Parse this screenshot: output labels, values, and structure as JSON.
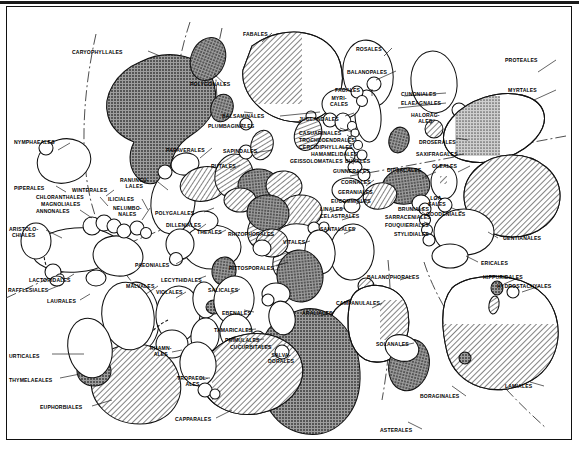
{
  "figure": {
    "kind": "taxonomic-bubble-diagram",
    "colors": {
      "outline": "#111111",
      "background": "#ffffff",
      "fill_dark": "#8d8d8d",
      "fill_hatch": "#b9b9b9",
      "fill_open": "#ffffff",
      "dash_boundary": "#333333"
    },
    "shading_legend_implicit": [
      "open",
      "stipple-dark",
      "diagonal-hatch"
    ]
  },
  "labels": [
    {
      "id": "caryophyllales",
      "text": "CARYOPHYLLALES",
      "x": 72,
      "y": 50,
      "align": "left"
    },
    {
      "id": "fabales",
      "text": "FABALES",
      "x": 243,
      "y": 32,
      "align": "left"
    },
    {
      "id": "rosales",
      "text": "ROSALES",
      "x": 356,
      "y": 47,
      "align": "left"
    },
    {
      "id": "proteales",
      "text": "PROTEALES",
      "x": 505,
      "y": 58,
      "align": "left"
    },
    {
      "id": "balanopales",
      "text": "BALANOPALES",
      "x": 347,
      "y": 70,
      "align": "left"
    },
    {
      "id": "myrtales",
      "text": "MYRTALES",
      "x": 508,
      "y": 88,
      "align": "left"
    },
    {
      "id": "polygonales",
      "text": "POLYGONALES",
      "x": 190,
      "y": 82,
      "align": "left"
    },
    {
      "id": "cunoniales",
      "text": "CUNONIALES",
      "x": 401,
      "y": 92,
      "align": "left"
    },
    {
      "id": "fagales",
      "text": "FAGALES",
      "x": 335,
      "y": 88,
      "align": "left"
    },
    {
      "id": "elaeagnales",
      "text": "ELAEAGNALES",
      "x": 401,
      "y": 101,
      "align": "left"
    },
    {
      "id": "myricales",
      "text": "MYRI-\nCALES",
      "x": 330,
      "y": 96,
      "align": "left"
    },
    {
      "id": "balsaminales",
      "text": "BALSAMINALES",
      "x": 222,
      "y": 114,
      "align": "left"
    },
    {
      "id": "haloragales",
      "text": "HALORAG-\nALES",
      "x": 411,
      "y": 113,
      "align": "left"
    },
    {
      "id": "juglandales",
      "text": "JUGLANDALES",
      "x": 299,
      "y": 117,
      "align": "left"
    },
    {
      "id": "plumbaginales",
      "text": "PLUMBAGINALES",
      "x": 208,
      "y": 124,
      "align": "left"
    },
    {
      "id": "nymphaeales",
      "text": "NYMPHAEALES",
      "x": 14,
      "y": 140,
      "align": "left"
    },
    {
      "id": "casuarinales",
      "text": "CASUARINALES",
      "x": 299,
      "y": 131,
      "align": "left"
    },
    {
      "id": "droserales",
      "text": "DROSERALES",
      "x": 419,
      "y": 140,
      "align": "left"
    },
    {
      "id": "trochodendrales",
      "text": "TROCHODENDRALES",
      "x": 299,
      "y": 138,
      "align": "left"
    },
    {
      "id": "cercidiphyllales",
      "text": "CERCIDIPHYLLALES",
      "x": 299,
      "y": 145,
      "align": "left"
    },
    {
      "id": "papaverales",
      "text": "PAPAVERALES",
      "x": 166,
      "y": 148,
      "align": "left"
    },
    {
      "id": "sapindales",
      "text": "SAPINDALES",
      "x": 223,
      "y": 149,
      "align": "left"
    },
    {
      "id": "saxifragales",
      "text": "SAXIFRAGALES",
      "x": 416,
      "y": 152,
      "align": "left"
    },
    {
      "id": "hamamelidales",
      "text": "HAMAMELIDALES",
      "x": 311,
      "y": 152,
      "align": "left"
    },
    {
      "id": "oleales",
      "text": "OLEALES",
      "x": 432,
      "y": 164,
      "align": "left"
    },
    {
      "id": "geissolomatales",
      "text": "GEISSOLOMATALES",
      "x": 290,
      "y": 159,
      "align": "left"
    },
    {
      "id": "buxales",
      "text": "BUXALES",
      "x": 345,
      "y": 159,
      "align": "left"
    },
    {
      "id": "rutales",
      "text": "RUTALES",
      "x": 211,
      "y": 164,
      "align": "left"
    },
    {
      "id": "dipsacales",
      "text": "DIPSACALES",
      "x": 387,
      "y": 168,
      "align": "left"
    },
    {
      "id": "gunnerales",
      "text": "GUNNERALES",
      "x": 333,
      "y": 169,
      "align": "left"
    },
    {
      "id": "piperales",
      "text": "PIPERALES",
      "x": 14,
      "y": 186,
      "align": "left"
    },
    {
      "id": "winterales",
      "text": "WINTERALES",
      "x": 72,
      "y": 188,
      "align": "left"
    },
    {
      "id": "ranunculales",
      "text": "RANUNCU-\nLALES",
      "x": 120,
      "y": 178,
      "align": "left"
    },
    {
      "id": "cornales",
      "text": "CORNALES",
      "x": 341,
      "y": 180,
      "align": "left"
    },
    {
      "id": "chloranthales",
      "text": "CHLORANTHALES",
      "x": 36,
      "y": 195,
      "align": "left"
    },
    {
      "id": "magnoliales",
      "text": "MAGNOLIALES",
      "x": 41,
      "y": 202,
      "align": "left"
    },
    {
      "id": "geraniales",
      "text": "GERANIALES",
      "x": 338,
      "y": 190,
      "align": "left"
    },
    {
      "id": "iliciales",
      "text": "ILICIALES",
      "x": 108,
      "y": 197,
      "align": "left"
    },
    {
      "id": "annonales",
      "text": "ANNONALES",
      "x": 36,
      "y": 209,
      "align": "left"
    },
    {
      "id": "loasales",
      "text": "LOA-\nSALES",
      "x": 428,
      "y": 196,
      "align": "left"
    },
    {
      "id": "eucommiales",
      "text": "EUCOMMIALES",
      "x": 331,
      "y": 199,
      "align": "left"
    },
    {
      "id": "nelumbonales",
      "text": "NELUMBO-\nNALES",
      "x": 113,
      "y": 206,
      "align": "left"
    },
    {
      "id": "polygalales",
      "text": "POLYGALALES",
      "x": 155,
      "y": 211,
      "align": "left"
    },
    {
      "id": "linales",
      "text": "LINALES",
      "x": 320,
      "y": 207,
      "align": "left"
    },
    {
      "id": "goodeniales",
      "text": "GOODENIALES",
      "x": 426,
      "y": 212,
      "align": "left"
    },
    {
      "id": "brunniales",
      "text": "BRUNIALES",
      "x": 398,
      "y": 207,
      "align": "left"
    },
    {
      "id": "aristolochiales",
      "text": "ARISTOLO-\nCHIALES",
      "x": 9,
      "y": 227,
      "align": "left"
    },
    {
      "id": "dilleniales",
      "text": "DILLENIALES",
      "x": 166,
      "y": 223,
      "align": "left"
    },
    {
      "id": "theales",
      "text": "THEALES",
      "x": 197,
      "y": 230,
      "align": "left"
    },
    {
      "id": "rhizophorales",
      "text": "RHIZOPHORALES",
      "x": 228,
      "y": 232,
      "align": "left"
    },
    {
      "id": "celastrales",
      "text": "CELASTRALES",
      "x": 320,
      "y": 214,
      "align": "left"
    },
    {
      "id": "santalales",
      "text": "SANTALALES",
      "x": 320,
      "y": 227,
      "align": "left"
    },
    {
      "id": "sarraceniales",
      "text": "SARRACENIALES",
      "x": 385,
      "y": 215,
      "align": "left"
    },
    {
      "id": "gentianales",
      "text": "GENTIANALES",
      "x": 503,
      "y": 236,
      "align": "left"
    },
    {
      "id": "fouquieriales",
      "text": "FOUQUIERIALES",
      "x": 385,
      "y": 223,
      "align": "left"
    },
    {
      "id": "vitales",
      "text": "VITALES",
      "x": 283,
      "y": 240,
      "align": "left"
    },
    {
      "id": "stylidiales",
      "text": "STYLIDIALES",
      "x": 394,
      "y": 232,
      "align": "left"
    },
    {
      "id": "ericales",
      "text": "ERICALES",
      "x": 481,
      "y": 261,
      "align": "left"
    },
    {
      "id": "paeoniales",
      "text": "PAEONIALES",
      "x": 135,
      "y": 263,
      "align": "left"
    },
    {
      "id": "pittosporales",
      "text": "PITTOSPORALES",
      "x": 229,
      "y": 266,
      "align": "left"
    },
    {
      "id": "balanophorales",
      "text": "BALANOPHORALES",
      "x": 367,
      "y": 275,
      "align": "left"
    },
    {
      "id": "lecythidales",
      "text": "LECYTHIDALES",
      "x": 161,
      "y": 278,
      "align": "left"
    },
    {
      "id": "hippuridales",
      "text": "HIPPURIDALES",
      "x": 483,
      "y": 275,
      "align": "left"
    },
    {
      "id": "hydrostachyales",
      "text": "HYDROSTACHYALES",
      "x": 497,
      "y": 284,
      "align": "left"
    },
    {
      "id": "lactoridales",
      "text": "LACTORIDALES",
      "x": 29,
      "y": 278,
      "align": "left"
    },
    {
      "id": "malvales",
      "text": "MALVALES",
      "x": 126,
      "y": 284,
      "align": "left"
    },
    {
      "id": "rafflesiales",
      "text": "RAFFLESIALES",
      "x": 8,
      "y": 288,
      "align": "left"
    },
    {
      "id": "violales",
      "text": "VIOLALES",
      "x": 156,
      "y": 290,
      "align": "left"
    },
    {
      "id": "salicales",
      "text": "SALICALES",
      "x": 208,
      "y": 288,
      "align": "left"
    },
    {
      "id": "campanulales",
      "text": "CAMPANULALES",
      "x": 336,
      "y": 301,
      "align": "left"
    },
    {
      "id": "laurales",
      "text": "LAURALES",
      "x": 47,
      "y": 299,
      "align": "left"
    },
    {
      "id": "araliales",
      "text": "ARALIALES",
      "x": 302,
      "y": 311,
      "align": "left"
    },
    {
      "id": "ebenales",
      "text": "EBENALES",
      "x": 222,
      "y": 311,
      "align": "left"
    },
    {
      "id": "tamaricales",
      "text": "TAMARICALES",
      "x": 214,
      "y": 328,
      "align": "left"
    },
    {
      "id": "solanales",
      "text": "SOLANALES",
      "x": 376,
      "y": 342,
      "align": "left"
    },
    {
      "id": "primulales",
      "text": "PRIMULALES",
      "x": 225,
      "y": 338,
      "align": "left"
    },
    {
      "id": "urticales",
      "text": "URTICALES",
      "x": 9,
      "y": 354,
      "align": "left"
    },
    {
      "id": "rhamnales",
      "text": "RHAMN-\nALES",
      "x": 150,
      "y": 346,
      "align": "left"
    },
    {
      "id": "cucurbitales",
      "text": "CUCURBITALES",
      "x": 230,
      "y": 345,
      "align": "left"
    },
    {
      "id": "salvadorales",
      "text": "SALVA-\nDORALES",
      "x": 268,
      "y": 353,
      "align": "left"
    },
    {
      "id": "thymelaeales",
      "text": "THYMELAEALES",
      "x": 9,
      "y": 378,
      "align": "left"
    },
    {
      "id": "tropaeolales",
      "text": "TROPAEOL-\nALES",
      "x": 177,
      "y": 376,
      "align": "left"
    },
    {
      "id": "lamiales",
      "text": "LAMIALES",
      "x": 505,
      "y": 384,
      "align": "left"
    },
    {
      "id": "boraginales",
      "text": "BORAGINALES",
      "x": 420,
      "y": 394,
      "align": "left"
    },
    {
      "id": "euphorbiales",
      "text": "EUPHORBIALES",
      "x": 40,
      "y": 405,
      "align": "left"
    },
    {
      "id": "capparales",
      "text": "CAPPARALES",
      "x": 175,
      "y": 417,
      "align": "left"
    },
    {
      "id": "asterales",
      "text": "ASTERALES",
      "x": 380,
      "y": 428,
      "align": "left"
    }
  ]
}
